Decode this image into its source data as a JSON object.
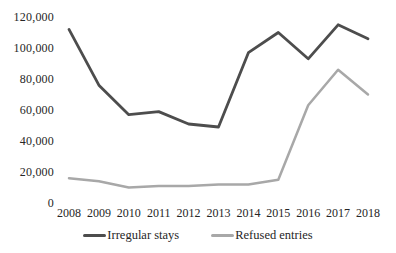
{
  "chart_data": {
    "type": "line",
    "title": "",
    "xlabel": "",
    "ylabel": "",
    "x": [
      2008,
      2009,
      2010,
      2011,
      2012,
      2013,
      2014,
      2015,
      2016,
      2017,
      2018
    ],
    "series": [
      {
        "name": "Irregular stays",
        "color": "#4d4d4d",
        "values": [
          112000,
          76000,
          57000,
          59000,
          51000,
          49000,
          97000,
          110000,
          93000,
          115000,
          106000
        ]
      },
      {
        "name": "Refused entries",
        "color": "#a8a8a8",
        "values": [
          16000,
          14000,
          10000,
          11000,
          11000,
          12000,
          12000,
          15000,
          63000,
          86000,
          70000
        ]
      }
    ],
    "ylim": [
      0,
      120000
    ],
    "y_tick_interval": 20000,
    "y_tick_labels": [
      "0",
      "20,000",
      "40,000",
      "60,000",
      "80,000",
      "100,000",
      "120,000"
    ],
    "grid": false,
    "legend_position": "bottom",
    "background_color": "#ffffff",
    "text_color": "#262626"
  }
}
